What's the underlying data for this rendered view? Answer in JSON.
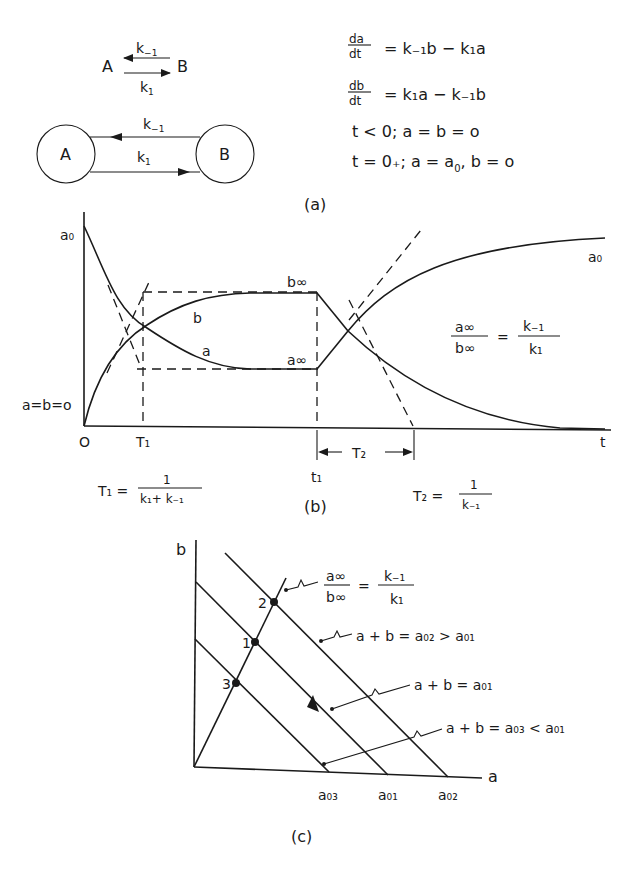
{
  "panel_a": {
    "scheme_top": {
      "species_left": "A",
      "species_right": "B",
      "rate_back": "k",
      "rate_back_sub": "−1",
      "rate_fwd": "k",
      "rate_fwd_sub": "1"
    },
    "scheme_circles": {
      "left": "A",
      "right": "B",
      "rate_back": "k",
      "rate_back_sub": "−1",
      "rate_fwd": "k",
      "rate_fwd_sub": "1"
    },
    "equations": {
      "eq1_num": "da",
      "eq1_den": "dt",
      "eq1_rhs": "= k₋₁b − k₁a",
      "eq2_num": "db",
      "eq2_den": "dt",
      "eq2_rhs": "= k₁a − k₋₁b",
      "eq3": "t < 0;  a = b = o",
      "eq4_pre": "t = 0₊;  a = a",
      "eq4_sub": "0",
      "eq4_post": ",  b = o"
    },
    "caption": "(a)"
  },
  "panel_b": {
    "y_label_top": "a₀",
    "y_label_origin": "a=b=o",
    "x_labels": {
      "origin": "O",
      "T1": "T₁",
      "t1": "t₁",
      "t": "t",
      "T2": "T₂"
    },
    "curve_labels": {
      "b": "b",
      "a": "a",
      "b_inf": "b∞",
      "a_inf": "a∞",
      "a0_right": "a₀"
    },
    "ratio": {
      "num": "a∞",
      "den": "b∞",
      "eq": "=",
      "rnum": "k₋₁",
      "rden": "k₁"
    },
    "T1_formula": {
      "lhs": "T₁ =",
      "num": "1",
      "den": "k₁+ k₋₁"
    },
    "T2_formula": {
      "lhs": "T₂ =",
      "num": "1",
      "den": "k₋₁"
    },
    "caption": "(b)"
  },
  "panel_c": {
    "axis_y": "b",
    "axis_x": "a",
    "points": [
      "1",
      "2",
      "3"
    ],
    "x_ticks": [
      "a₀₃",
      "a₀₁",
      "a₀₂"
    ],
    "labels": {
      "ratio_num": "a∞",
      "ratio_den": "b∞",
      "ratio_eq": "=",
      "ratio_rnum": "k₋₁",
      "ratio_rden": "k₁",
      "line_02": "a + b = a₀₂ > a₀₁",
      "line_01": "a + b = a₀₁",
      "line_03": "a + b = a₀₃ < a₀₁"
    },
    "caption": "(c)"
  }
}
